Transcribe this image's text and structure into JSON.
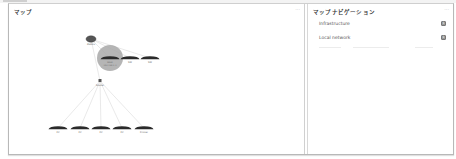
{
  "top_strip": {
    "breadcrumb": ""
  },
  "map_panel": {
    "title": "マップ",
    "menu_icon": "more-icon",
    "nodes": [
      {
        "id": "root",
        "label": "Zabbix",
        "sublabel": "",
        "x": 82,
        "y": 35,
        "type": "server"
      },
      {
        "id": "highlight",
        "label": "Host",
        "sublabel": "192.168.1.1",
        "x": 101,
        "y": 54,
        "type": "switch",
        "highlight": true
      },
      {
        "id": "sw2",
        "label": "SW",
        "sublabel": "",
        "x": 121,
        "y": 54,
        "type": "switch"
      },
      {
        "id": "sw3",
        "label": "SW",
        "sublabel": "",
        "x": 141,
        "y": 54,
        "type": "switch"
      },
      {
        "id": "hub",
        "label": "Router",
        "sublabel": "",
        "x": 91,
        "y": 77,
        "type": "router"
      },
      {
        "id": "leaf1",
        "label": "PC",
        "sublabel": "",
        "x": 49,
        "y": 124,
        "type": "switch"
      },
      {
        "id": "leaf2",
        "label": "PC",
        "sublabel": "",
        "x": 71,
        "y": 124,
        "type": "switch"
      },
      {
        "id": "leaf3",
        "label": "PC",
        "sublabel": "",
        "x": 92,
        "y": 124,
        "type": "switch"
      },
      {
        "id": "leaf4",
        "label": "PC",
        "sublabel": "",
        "x": 113,
        "y": 124,
        "type": "switch"
      },
      {
        "id": "leaf5",
        "label": "Printer",
        "sublabel": "",
        "x": 135,
        "y": 124,
        "type": "switch"
      }
    ],
    "links": [
      [
        "root",
        "highlight"
      ],
      [
        "root",
        "sw2"
      ],
      [
        "root",
        "sw3"
      ],
      [
        "root",
        "hub"
      ],
      [
        "hub",
        "leaf1"
      ],
      [
        "hub",
        "leaf2"
      ],
      [
        "hub",
        "leaf3"
      ],
      [
        "hub",
        "leaf4"
      ],
      [
        "hub",
        "leaf5"
      ]
    ],
    "colors": {
      "highlight_fill": "#a8a8a8",
      "node_dark": "#2b2b2b",
      "link": "#c8c8c8"
    }
  },
  "nav_panel": {
    "title": "マップナビゲーション",
    "menu_icon": "more-icon",
    "items": [
      {
        "label": "Infrastructure",
        "badge": "1"
      },
      {
        "label": "Local network",
        "badge": "1"
      }
    ]
  }
}
